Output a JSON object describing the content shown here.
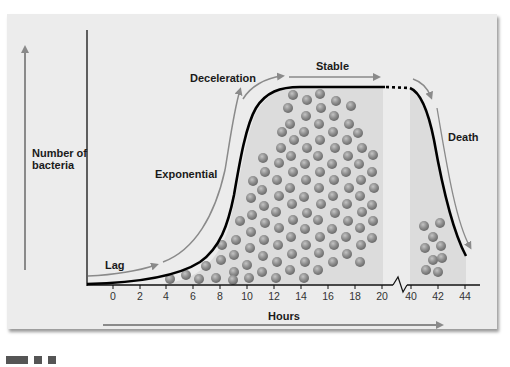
{
  "diagram": {
    "y_axis_label_line1": "Number of",
    "y_axis_label_line2": "bacteria",
    "x_axis_label": "Hours",
    "phases": {
      "lag": "Lag",
      "exponential": "Exponential",
      "deceleration": "Deceleration",
      "stable": "Stable",
      "death": "Death"
    },
    "x_ticks": [
      "0",
      "2",
      "4",
      "6",
      "8",
      "10",
      "12",
      "14",
      "16",
      "18",
      "20",
      "40",
      "42",
      "44"
    ],
    "axis_break_between": [
      "20",
      "40"
    ],
    "colors": {
      "panel": "#ececec",
      "curve": "#000000",
      "arrows": "#8a8a8a",
      "shade": "#d9d9d9",
      "bacteria": "#8c8c8c"
    }
  }
}
